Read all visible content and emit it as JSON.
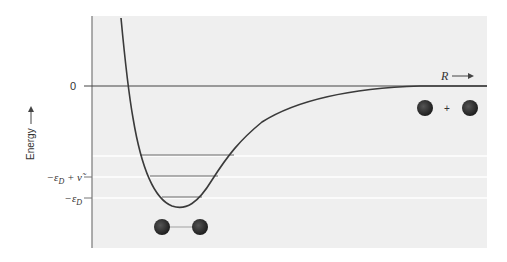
{
  "diagram": {
    "y_axis_label": "Energy",
    "x_axis_label": "R",
    "tick_zero": "0",
    "tick_level1": "−ε",
    "tick_level1_sub": "D",
    "tick_level1_suffix": " + ν̃",
    "tick_level2": "−ε",
    "tick_level2_sub": "D",
    "separated_atoms_plus": "+",
    "colors": {
      "background_panel": "#efefef",
      "curve": "#3a3a3a",
      "atom": "#2a2a2a",
      "gridline": "#ffffff"
    },
    "vibrational_levels": 3
  }
}
